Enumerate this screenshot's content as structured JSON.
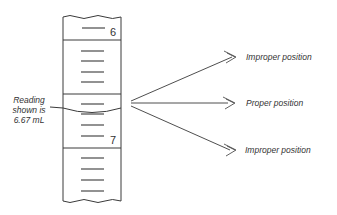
{
  "diagram": {
    "burette": {
      "scale_numbers": [
        "6",
        "7"
      ],
      "reading_label": [
        "Reading",
        "shown is",
        "6.67 mL"
      ]
    },
    "positions": [
      {
        "label": "Improper position",
        "kind": "improper",
        "y": 57
      },
      {
        "label": "Proper position",
        "kind": "proper",
        "y": 103
      },
      {
        "label": "Improper position",
        "kind": "improper",
        "y": 150
      }
    ],
    "colors": {
      "line": "#3a3a3a",
      "text": "#333333",
      "background": "#ffffff"
    }
  }
}
